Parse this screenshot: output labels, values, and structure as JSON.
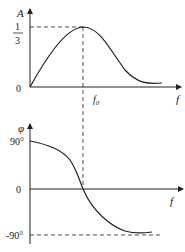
{
  "amplitude_plot": {
    "y_label": "A",
    "x_label": "f",
    "peak_numerator": "1",
    "peak_denominator": "3",
    "origin_label": "0",
    "center_freq_label": "f",
    "center_freq_sub": "0"
  },
  "phase_plot": {
    "y_label": "φ",
    "x_label": "f",
    "top_label": "90°",
    "zero_label": "0",
    "bottom_label": "-90°"
  },
  "colors": {
    "line": "#222222",
    "background": "#ffffff"
  }
}
